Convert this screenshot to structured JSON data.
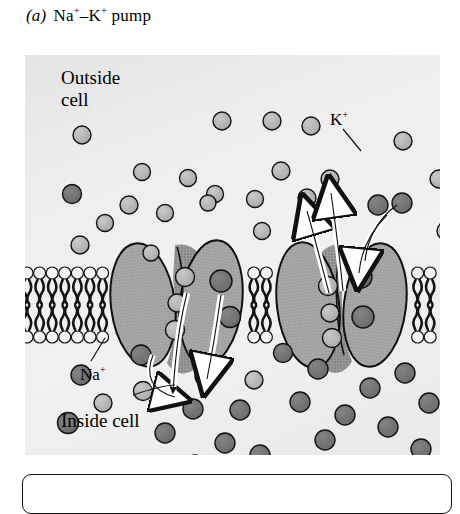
{
  "figure": {
    "panel_letter": "(a)",
    "title_parts": [
      "Na",
      "+",
      "–K",
      "+",
      " pump"
    ],
    "title_plain": "Na+–K+ pump"
  },
  "labels": {
    "outside": "Outside\ncell",
    "inside": "Inside cell",
    "sodium": "Na",
    "sodium_charge": "+",
    "potassium": "K",
    "potassium_charge": "+"
  },
  "colors": {
    "background": "#eeeeee",
    "sodium_ion": "#b3b3b3",
    "potassium_ion": "#707070",
    "protein_body": "#a9a9a9",
    "protein_shadow": "#8a8a8a",
    "membrane_head": "#f2f2f2",
    "membrane_tail": "#1a1a1a",
    "outline": "#111111",
    "arrow_white": "#ffffff",
    "arrow_black": "#111111"
  },
  "diagram": {
    "type": "cell-membrane-transport",
    "membrane": {
      "top_y": 212,
      "bottom_y": 288,
      "leaflets": 2,
      "head_radius": 6.0,
      "head_spacing": 12.6
    },
    "proteins": [
      {
        "name": "pump-left-lobe-a",
        "cx": 118,
        "cy": 250,
        "rx": 32,
        "ry": 62,
        "tilt": -7
      },
      {
        "name": "pump-left-lobe-b",
        "cx": 186,
        "cy": 248,
        "rx": 31,
        "ry": 63,
        "tilt": 7
      },
      {
        "name": "pump-right-lobe-a",
        "cx": 283,
        "cy": 250,
        "rx": 31,
        "ry": 63,
        "tilt": -7
      },
      {
        "name": "pump-right-lobe-b",
        "cx": 350,
        "cy": 250,
        "rx": 31,
        "ry": 62,
        "tilt": 7
      }
    ],
    "bound_ions": [
      {
        "pump": "left",
        "species": "Na",
        "cx": 160,
        "cy": 222,
        "r": 9.5
      },
      {
        "pump": "left",
        "species": "Na",
        "cx": 152,
        "cy": 248,
        "r": 9.0
      },
      {
        "pump": "left",
        "species": "Na",
        "cx": 150,
        "cy": 275,
        "r": 9.5
      },
      {
        "pump": "left",
        "species": "K",
        "cx": 196,
        "cy": 226,
        "r": 11.0
      },
      {
        "pump": "left",
        "species": "K",
        "cx": 205,
        "cy": 262,
        "r": 10.5
      },
      {
        "pump": "right",
        "species": "Na",
        "cx": 303,
        "cy": 231,
        "r": 9.5
      },
      {
        "pump": "right",
        "species": "Na",
        "cx": 305,
        "cy": 258,
        "r": 9.0
      },
      {
        "pump": "right",
        "species": "Na",
        "cx": 307,
        "cy": 283,
        "r": 9.5
      },
      {
        "pump": "right",
        "species": "K",
        "cx": 336,
        "cy": 222,
        "r": 11.0
      },
      {
        "pump": "right",
        "species": "K",
        "cx": 338,
        "cy": 262,
        "r": 11.0
      }
    ],
    "arrows": [
      {
        "name": "na-efflux-white-left",
        "style": "white",
        "direction": "down"
      },
      {
        "name": "na-efflux-black-left",
        "style": "black",
        "direction": "down"
      },
      {
        "name": "na-influx-white-left",
        "style": "white",
        "direction": "up"
      },
      {
        "name": "na-entry-black-left",
        "style": "black",
        "direction": "up"
      },
      {
        "name": "k-efflux-white-right-1",
        "style": "white",
        "direction": "up"
      },
      {
        "name": "k-efflux-white-right-2",
        "style": "white",
        "direction": "up"
      },
      {
        "name": "k-influx-white-right",
        "style": "white",
        "direction": "down"
      },
      {
        "name": "k-entry-black-right",
        "style": "black",
        "direction": "down"
      }
    ],
    "outside_ions": [
      {
        "s": "Na",
        "x": 57,
        "y": 80,
        "r": 9
      },
      {
        "s": "Na",
        "x": 117,
        "y": 117,
        "r": 8.5
      },
      {
        "s": "K",
        "x": 47,
        "y": 139,
        "r": 9.5
      },
      {
        "s": "Na",
        "x": 104,
        "y": 150,
        "r": 9
      },
      {
        "s": "Na",
        "x": 140,
        "y": 158,
        "r": 8.5
      },
      {
        "s": "Na",
        "x": 80,
        "y": 168,
        "r": 8.5
      },
      {
        "s": "Na",
        "x": 55,
        "y": 190,
        "r": 9
      },
      {
        "s": "Na",
        "x": 163,
        "y": 123,
        "r": 8.5
      },
      {
        "s": "Na",
        "x": 197,
        "y": 66,
        "r": 9
      },
      {
        "s": "Na",
        "x": 190,
        "y": 139,
        "r": 8.5
      },
      {
        "s": "Na",
        "x": 183,
        "y": 148,
        "r": 8
      },
      {
        "s": "Na",
        "x": 230,
        "y": 144,
        "r": 8.5
      },
      {
        "s": "Na",
        "x": 247,
        "y": 66,
        "r": 9
      },
      {
        "s": "Na",
        "x": 256,
        "y": 116,
        "r": 9
      },
      {
        "s": "Na",
        "x": 237,
        "y": 176,
        "r": 8.5
      },
      {
        "s": "Na",
        "x": 286,
        "y": 71,
        "r": 9
      },
      {
        "s": "Na",
        "x": 282,
        "y": 143,
        "r": 9
      },
      {
        "s": "Na",
        "x": 305,
        "y": 124,
        "r": 9
      },
      {
        "s": "K",
        "x": 353,
        "y": 150,
        "r": 10
      },
      {
        "s": "K",
        "x": 377,
        "y": 148,
        "r": 10
      },
      {
        "s": "Na",
        "x": 378,
        "y": 86,
        "r": 9
      },
      {
        "s": "Na",
        "x": 414,
        "y": 124,
        "r": 9
      },
      {
        "s": "Na",
        "x": 421,
        "y": 176,
        "r": 9
      },
      {
        "s": "Na",
        "x": 126,
        "y": 198,
        "r": 8
      }
    ],
    "inside_ions": [
      {
        "s": "K",
        "x": 56,
        "y": 320,
        "r": 10
      },
      {
        "s": "Na",
        "x": 78,
        "y": 348,
        "r": 9
      },
      {
        "s": "Na",
        "x": 118,
        "y": 336,
        "r": 9.5
      },
      {
        "s": "K",
        "x": 43,
        "y": 368,
        "r": 10.5
      },
      {
        "s": "K",
        "x": 140,
        "y": 378,
        "r": 10
      },
      {
        "s": "K",
        "x": 168,
        "y": 354,
        "r": 10
      },
      {
        "s": "K",
        "x": 180,
        "y": 321,
        "r": 10
      },
      {
        "s": "K",
        "x": 200,
        "y": 388,
        "r": 10
      },
      {
        "s": "Na",
        "x": 229,
        "y": 325,
        "r": 9
      },
      {
        "s": "K",
        "x": 170,
        "y": 410,
        "r": 10
      },
      {
        "s": "K",
        "x": 215,
        "y": 355,
        "r": 10
      },
      {
        "s": "K",
        "x": 235,
        "y": 400,
        "r": 10
      },
      {
        "s": "K",
        "x": 275,
        "y": 347,
        "r": 10
      },
      {
        "s": "K",
        "x": 293,
        "y": 314,
        "r": 10
      },
      {
        "s": "K",
        "x": 300,
        "y": 385,
        "r": 10
      },
      {
        "s": "K",
        "x": 320,
        "y": 360,
        "r": 10
      },
      {
        "s": "K",
        "x": 345,
        "y": 333,
        "r": 10
      },
      {
        "s": "K",
        "x": 363,
        "y": 372,
        "r": 10
      },
      {
        "s": "K",
        "x": 380,
        "y": 318,
        "r": 10
      },
      {
        "s": "K",
        "x": 404,
        "y": 348,
        "r": 10
      },
      {
        "s": "K",
        "x": 396,
        "y": 394,
        "r": 10
      },
      {
        "s": "K",
        "x": 258,
        "y": 298,
        "r": 9.5
      },
      {
        "s": "K",
        "x": 116,
        "y": 300,
        "r": 10
      }
    ]
  }
}
